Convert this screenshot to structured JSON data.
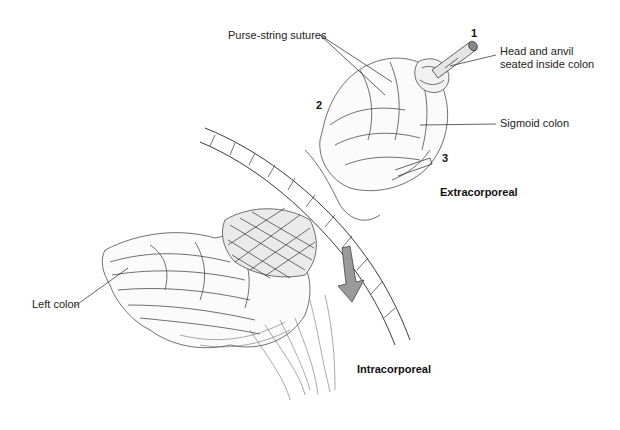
{
  "figure": {
    "type": "anatomical line illustration",
    "labels": {
      "purse_string": "Purse-string sutures",
      "head_anvil_line1": "Head and anvil",
      "head_anvil_line2": "seated inside colon",
      "sigmoid": "Sigmoid colon",
      "left_colon": "Left colon"
    },
    "numbers": {
      "n1": "1",
      "n2": "2",
      "n3": "3"
    },
    "regions": {
      "extracorporeal": "Extracorporeal",
      "intracorporeal": "Intracorporeal"
    },
    "colors": {
      "line": "#222222",
      "background": "#ffffff",
      "arrow_fill": "#9a9a9a"
    }
  }
}
